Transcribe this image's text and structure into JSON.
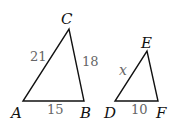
{
  "diagram": {
    "triangles": [
      {
        "name": "ABC",
        "vertices": {
          "A": "A",
          "B": "B",
          "C": "C"
        },
        "sides": {
          "AC": "21",
          "BC": "18",
          "AB": "15"
        }
      },
      {
        "name": "DEF",
        "vertices": {
          "D": "D",
          "E": "E",
          "F": "F"
        },
        "sides": {
          "DE": "x",
          "DF": "10"
        }
      }
    ],
    "stroke_color": "#111111",
    "side_label_color": "#666666"
  }
}
